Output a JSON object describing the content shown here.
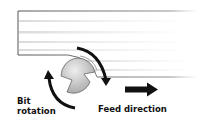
{
  "diagram": {
    "labels": {
      "bit_rotation_line1": "Bit",
      "bit_rotation_line2": "rotation",
      "feed_direction": "Feed direction"
    },
    "components": [
      "workpiece-board",
      "router-bit",
      "rotation-arrows",
      "feed-arrow"
    ],
    "colors": {
      "board_outline": "#555555",
      "board_grain": "#d8d8d8",
      "bit_fill": "#c8c8c8",
      "arrow": "#111111",
      "text": "#111111"
    }
  }
}
